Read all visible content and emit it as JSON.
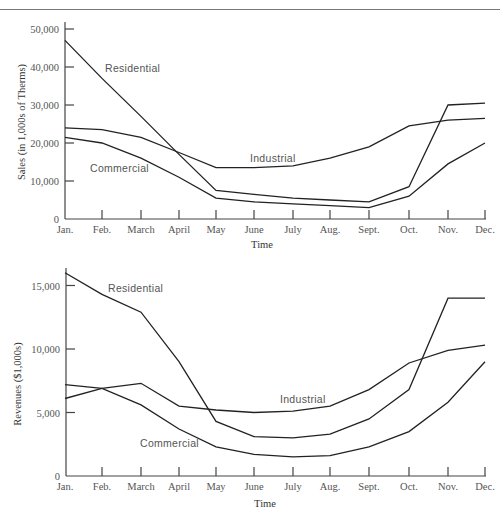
{
  "chart_data": [
    {
      "type": "line",
      "title": "",
      "xlabel": "Time",
      "ylabel": "Sales (in 1,000s of Therms)",
      "categories": [
        "Jan.",
        "Feb.",
        "March",
        "April",
        "May",
        "June",
        "July",
        "Aug.",
        "Sept.",
        "Oct.",
        "Nov.",
        "Dec."
      ],
      "yticks": [
        0,
        10000,
        20000,
        30000,
        40000,
        50000
      ],
      "ytick_labels": [
        "0",
        "10,000",
        "20,000",
        "30,000",
        "40,000",
        "50,000"
      ],
      "ylim": [
        0,
        50000
      ],
      "grid": false,
      "legend": "inline labels",
      "series": [
        {
          "name": "Residential",
          "values": [
            47000,
            37000,
            27000,
            17000,
            7500,
            6500,
            5500,
            5000,
            4500,
            8500,
            30000,
            30500
          ]
        },
        {
          "name": "Industrial",
          "values": [
            24000,
            23500,
            21500,
            17500,
            13500,
            13500,
            14000,
            16000,
            19000,
            24500,
            26000,
            26500
          ]
        },
        {
          "name": "Commercial",
          "values": [
            21500,
            20000,
            16000,
            11000,
            5500,
            4500,
            4000,
            3500,
            3000,
            6000,
            14500,
            20000
          ]
        }
      ],
      "annotations": [
        {
          "text": "Residential",
          "x": "Feb.",
          "y": 40000
        },
        {
          "text": "Industrial",
          "x": "June",
          "y": 16000
        },
        {
          "text": "Commercial",
          "x": "Feb.",
          "y": 13000
        }
      ]
    },
    {
      "type": "line",
      "title": "",
      "xlabel": "Time",
      "ylabel": "Revenues ($1,000s)",
      "categories": [
        "Jan.",
        "Feb.",
        "March",
        "April",
        "May",
        "June",
        "July",
        "Aug.",
        "Sept.",
        "Oct.",
        "Nov.",
        "Dec."
      ],
      "yticks": [
        0,
        5000,
        10000,
        15000
      ],
      "ytick_labels": [
        "0",
        "5,000",
        "10,000",
        "15,000"
      ],
      "ylim": [
        0,
        16000
      ],
      "grid": false,
      "legend": "inline labels",
      "series": [
        {
          "name": "Residential",
          "values": [
            16000,
            14300,
            12900,
            9000,
            4300,
            3100,
            3000,
            3300,
            4500,
            6800,
            14000,
            14000
          ]
        },
        {
          "name": "Industrial",
          "values": [
            6100,
            6900,
            7300,
            5500,
            5200,
            5000,
            5100,
            5500,
            6800,
            8900,
            9900,
            10300
          ]
        },
        {
          "name": "Commercial",
          "values": [
            7200,
            6900,
            5600,
            3700,
            2300,
            1700,
            1500,
            1600,
            2300,
            3500,
            5800,
            9000
          ]
        }
      ],
      "annotations": [
        {
          "text": "Residential",
          "x": "Feb.",
          "y": 15000
        },
        {
          "text": "Industrial",
          "x": "July",
          "y": 6200
        },
        {
          "text": "Commercial",
          "x": "April",
          "y": 2800
        }
      ]
    }
  ],
  "labels": {
    "top": {
      "ylabel": "Sales (in 1,000s of Therms)",
      "xlabel": "Time",
      "residential": "Residential",
      "industrial": "Industrial",
      "commercial": "Commercial",
      "y0": "0",
      "y1": "10,000",
      "y2": "20,000",
      "y3": "30,000",
      "y4": "40,000",
      "y5": "50,000"
    },
    "bottom": {
      "ylabel": "Revenues ($1,000s)",
      "xlabel": "Time",
      "residential": "Residential",
      "industrial": "Industrial",
      "commercial": "Commercial",
      "y0": "0",
      "y1": "5,000",
      "y2": "10,000",
      "y3": "15,000"
    },
    "months": [
      "Jan.",
      "Feb.",
      "March",
      "April",
      "May",
      "June",
      "July",
      "Aug.",
      "Sept.",
      "Oct.",
      "Nov.",
      "Dec."
    ]
  }
}
